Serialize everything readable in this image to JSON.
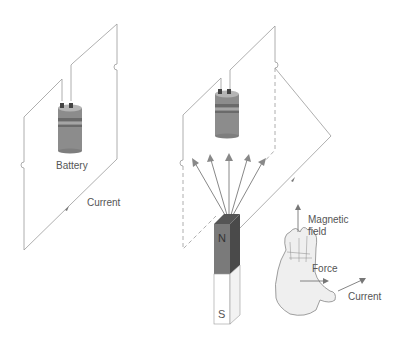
{
  "figure": {
    "left_panel": {
      "battery_label": "Battery",
      "current_label": "Current"
    },
    "right_panel": {
      "magnet": {
        "north_label": "N",
        "south_label": "S"
      },
      "hand_rule": {
        "magnetic_field_label_line1": "Magnetic",
        "magnetic_field_label_line2": "field",
        "force_label": "Force",
        "current_label": "Current"
      }
    },
    "colors": {
      "wire": "#9a9a9a",
      "battery_body": "#8c8c8c",
      "magnet_north": "#7a7a7a",
      "magnet_north_side": "#555555",
      "magnet_south": "#ffffff",
      "field_arrows": "#888888",
      "text": "#555555"
    }
  }
}
